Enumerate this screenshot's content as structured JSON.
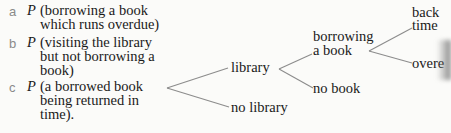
{
  "questions": [
    {
      "label": "a",
      "symbol": "P",
      "lines": [
        "(borrowing a book",
        "which runs overdue)"
      ]
    },
    {
      "label": "b",
      "symbol": "P",
      "lines": [
        "(visiting the library",
        "but not borrowing a",
        "book)"
      ]
    },
    {
      "label": "c",
      "symbol": "P",
      "lines": [
        "(a borrowed book",
        "being returned in",
        "time)."
      ]
    }
  ],
  "tree": {
    "level1": {
      "top": "library",
      "bottom": "no library"
    },
    "level2": {
      "top_lines": [
        "borrowing",
        "a book"
      ],
      "bottom": "no book"
    },
    "level3": {
      "top_lines": [
        "back",
        "time"
      ],
      "bottom": "overe"
    }
  }
}
